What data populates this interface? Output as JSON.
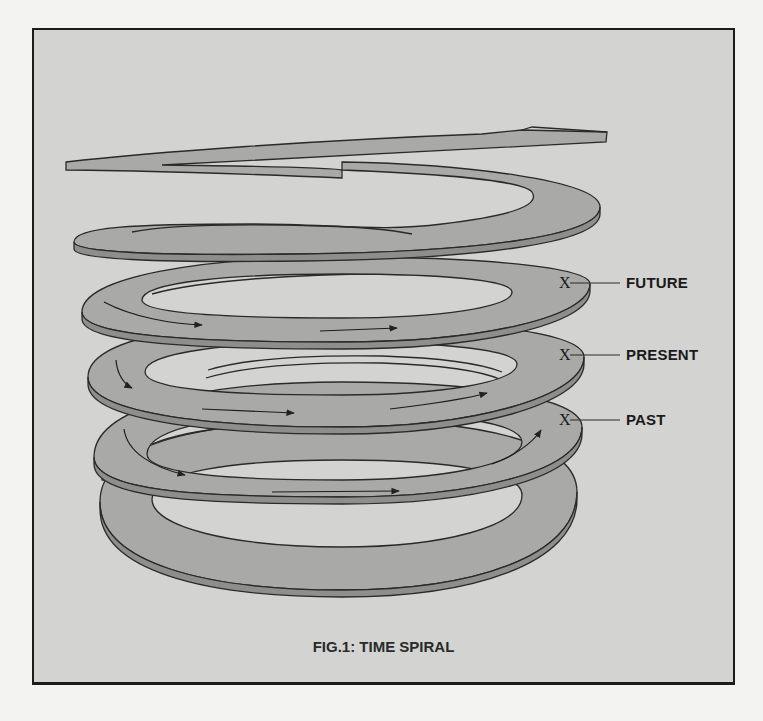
{
  "figure": {
    "caption": "FIG.1: TIME SPIRAL",
    "labels": [
      {
        "id": "future",
        "text": "FUTURE",
        "marker": "X"
      },
      {
        "id": "present",
        "text": "PRESENT",
        "marker": "X"
      },
      {
        "id": "past",
        "text": "PAST",
        "marker": "X"
      }
    ],
    "colors": {
      "background": "#f3f3f1",
      "panel": "#d3d3d1",
      "ribbon": "#a9a9a7",
      "ribbon_edge": "#8e8e8c",
      "stroke": "#2a2a2a"
    }
  }
}
